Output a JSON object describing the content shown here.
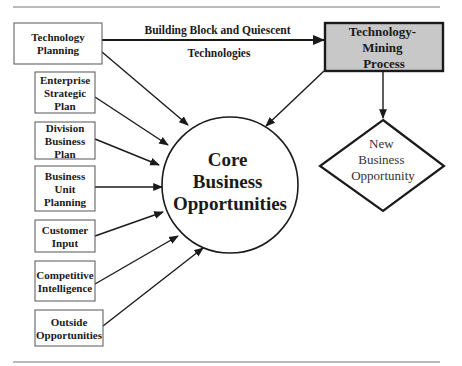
{
  "diagram": {
    "colors": {
      "stroke": "#1a1a1a",
      "rule": "#777777",
      "mining_fill": "#c8c8c8",
      "background": "#ffffff"
    },
    "inputs": [
      {
        "id": "technology-planning",
        "lines": [
          "Technology",
          "Planning"
        ]
      },
      {
        "id": "enterprise-strategic-plan",
        "lines": [
          "Enterprise",
          "Strategic",
          "Plan"
        ]
      },
      {
        "id": "division-business-plan",
        "lines": [
          "Division",
          "Business",
          "Plan"
        ]
      },
      {
        "id": "business-unit-planning",
        "lines": [
          "Business",
          "Unit",
          "Planning"
        ]
      },
      {
        "id": "customer-input",
        "lines": [
          "Customer",
          "Input"
        ]
      },
      {
        "id": "competitive-intelligence",
        "lines": [
          "Competitive",
          "Intelligence"
        ]
      },
      {
        "id": "outside-opportunities",
        "lines": [
          "Outside",
          "Opportunities"
        ]
      }
    ],
    "core": {
      "lines": [
        "Core",
        "Business",
        "Opportunities"
      ]
    },
    "mining": {
      "lines": [
        "Technology-",
        "Mining",
        "Process"
      ]
    },
    "outcome": {
      "lines": [
        "New",
        "Business",
        "Opportunity"
      ]
    },
    "edge_label": {
      "lines": [
        "Building Block and Quiescent",
        "Technologies"
      ]
    },
    "edges": [
      {
        "from": "technology-planning",
        "to": "core"
      },
      {
        "from": "enterprise-strategic-plan",
        "to": "core"
      },
      {
        "from": "division-business-plan",
        "to": "core"
      },
      {
        "from": "business-unit-planning",
        "to": "core"
      },
      {
        "from": "customer-input",
        "to": "core"
      },
      {
        "from": "competitive-intelligence",
        "to": "core"
      },
      {
        "from": "outside-opportunities",
        "to": "core"
      },
      {
        "from": "technology-planning",
        "to": "mining",
        "label": "Building Block and Quiescent Technologies"
      },
      {
        "from": "mining",
        "to": "core"
      },
      {
        "from": "mining",
        "to": "outcome"
      }
    ]
  }
}
